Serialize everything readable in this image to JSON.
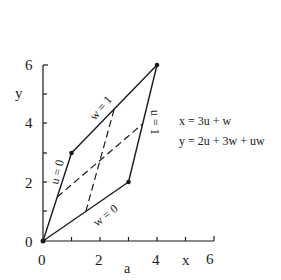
{
  "diagram": {
    "caption": "a",
    "x_axis": {
      "label": "x",
      "ticks": [
        "0",
        "2",
        "4",
        "6"
      ],
      "range": [
        0,
        6
      ]
    },
    "y_axis": {
      "label": "y",
      "ticks": [
        "0",
        "2",
        "4",
        "6"
      ],
      "range": [
        0,
        6
      ]
    },
    "equations": [
      "x = 3u + w",
      "y = 2u + 3w + uw"
    ],
    "edge_labels": {
      "u0": "u = 0",
      "u1": "u = 1",
      "w0": "w = 0",
      "w1": "w = 1"
    },
    "vertices": [
      {
        "u": 0,
        "w": 0,
        "x": 0,
        "y": 0
      },
      {
        "u": 0,
        "w": 1,
        "x": 1,
        "y": 3
      },
      {
        "u": 1,
        "w": 1,
        "x": 4,
        "y": 6
      },
      {
        "u": 1,
        "w": 0,
        "x": 3,
        "y": 2
      }
    ],
    "dashed_lines": [
      {
        "param": "u = 1/2",
        "from": [
          1.5,
          1
        ],
        "to": [
          2.5,
          4.5
        ]
      },
      {
        "param": "w = 1/2",
        "from": [
          0.5,
          1.5
        ],
        "to": [
          3.5,
          4
        ]
      }
    ],
    "colors": {
      "ink": "#1a1a1a",
      "background": "#ffffff"
    }
  }
}
